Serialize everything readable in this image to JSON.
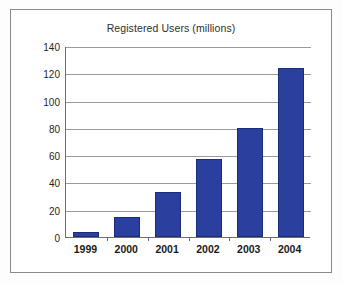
{
  "chart_data": {
    "type": "bar",
    "title": "Registered Users (millions)",
    "xlabel": "",
    "ylabel": "",
    "categories": [
      "1999",
      "2000",
      "2001",
      "2002",
      "2003",
      "2004"
    ],
    "values": [
      4,
      15,
      33,
      57,
      80,
      124
    ],
    "ylim": [
      0,
      140
    ],
    "yticks": [
      0,
      20,
      40,
      60,
      80,
      100,
      120,
      140
    ],
    "ytick_labels": [
      "0",
      "20",
      "40",
      "60",
      "80",
      "100",
      "120",
      "140"
    ],
    "grid": true,
    "legend": "none",
    "series": [
      {
        "name": "Registered Users (millions)",
        "values": [
          4,
          15,
          33,
          57,
          80,
          124
        ],
        "color": "#2b3f9e"
      }
    ],
    "colors": {
      "bar": "#2b3f9e",
      "bar_border": "#1b2c78",
      "gridline": "#9b9b9b",
      "axis": "#6d6d6d",
      "frame": "#8a8a8a",
      "background": "#ffffff",
      "title_text": "#2e2e2e",
      "tick_text": "#1a1a1a"
    }
  }
}
